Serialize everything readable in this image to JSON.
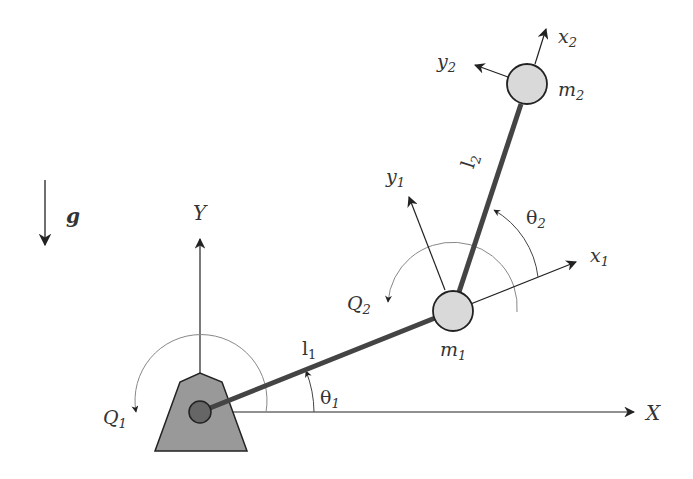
{
  "diagram": {
    "type": "two-link planar manipulator (double pendulum)",
    "colors": {
      "link": "#444444",
      "axis": "#222222",
      "arc": "#888888",
      "mass_fill": "#d9d9d9",
      "base_fill": "#999999",
      "pivot_fill": "#666666",
      "text": "#333333"
    },
    "gravity": {
      "symbol": "g"
    },
    "global_frame": {
      "x_label": "X",
      "y_label": "Y"
    },
    "base": {
      "torque_label": "Q",
      "torque_sub": "1"
    },
    "link1": {
      "length_label": "l",
      "length_sub": "1",
      "angle_label": "θ",
      "angle_sub": "1"
    },
    "mass1": {
      "label": "m",
      "sub": "1",
      "torque_label": "Q",
      "torque_sub": "2"
    },
    "frame1": {
      "x_label": "x",
      "x_sub": "1",
      "y_label": "y",
      "y_sub": "1"
    },
    "link2": {
      "length_label": "l",
      "length_sub": "2",
      "angle_label": "θ",
      "angle_sub": "2"
    },
    "mass2": {
      "label": "m",
      "sub": "2"
    },
    "frame2": {
      "x_label": "x",
      "x_sub": "2",
      "y_label": "y",
      "y_sub": "2"
    }
  }
}
